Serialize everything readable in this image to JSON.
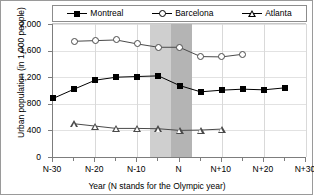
{
  "chart_data": {
    "type": "line",
    "title": "",
    "xlabel": "Year (N stands for the Olympic year)",
    "ylabel": "Urban population (in 1,000 people)",
    "x": [
      -30,
      -25,
      -20,
      -15,
      -10,
      -5,
      0,
      5,
      10,
      15,
      20,
      25
    ],
    "xtick_labels": [
      "N-30",
      "N-20",
      "N-10",
      "N",
      "N+10",
      "N+20",
      "N+30"
    ],
    "xtick_values": [
      -30,
      -20,
      -10,
      0,
      10,
      20,
      30
    ],
    "ytick_labels": [
      "0",
      "400",
      "800",
      "1,200",
      "1,600",
      "2,000"
    ],
    "ytick_values": [
      0,
      400,
      800,
      1200,
      1600,
      2000
    ],
    "ylim": [
      0,
      2000
    ],
    "xlim": [
      -30,
      30
    ],
    "grid": true,
    "legend_position": "top",
    "series": [
      {
        "name": "Montreal",
        "marker": "filled-square",
        "color": "#000000",
        "x": [
          -30,
          -25,
          -20,
          -15,
          -10,
          -5,
          0,
          5,
          10,
          15,
          20,
          25
        ],
        "values": [
          880,
          1020,
          1155,
          1200,
          1210,
          1220,
          1075,
          980,
          1005,
          1020,
          1010,
          1040
        ]
      },
      {
        "name": "Barcelona",
        "marker": "open-circle",
        "color": "#4a4a4a",
        "x": [
          -25,
          -20,
          -15,
          -10,
          -5,
          0,
          5,
          10,
          15
        ],
        "values": [
          1740,
          1750,
          1760,
          1700,
          1650,
          1650,
          1510,
          1505,
          1545
        ]
      },
      {
        "name": "Atlanta",
        "marker": "open-triangle",
        "color": "#4a4a4a",
        "x": [
          -25,
          -20,
          -15,
          -10,
          -5,
          0,
          5,
          10
        ],
        "values": [
          500,
          465,
          430,
          430,
          425,
          400,
          405,
          420
        ]
      }
    ],
    "shaded_bands": [
      {
        "name": "olympic-preparation-band",
        "from": -7,
        "to": -2,
        "color": "#cfcfcf"
      },
      {
        "name": "olympic-games-band",
        "from": -2,
        "to": 3,
        "color": "#b4b4b4"
      }
    ]
  },
  "legend": {
    "entries": [
      {
        "label": "Montreal",
        "marker": "filled-square-icon"
      },
      {
        "label": "Barcelona",
        "marker": "open-circle-icon"
      },
      {
        "label": "Atlanta",
        "marker": "open-triangle-icon"
      }
    ]
  }
}
